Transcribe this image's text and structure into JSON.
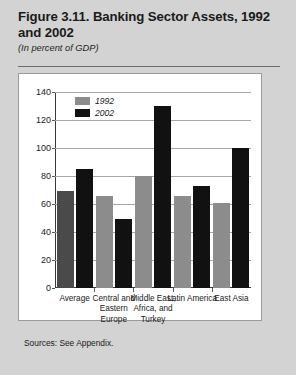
{
  "figure": {
    "title": "Figure 3.11. Banking Sector Assets, 1992 and 2002",
    "subtitle": "(In percent of GDP)",
    "sources": "Sources: See Appendix."
  },
  "colors": {
    "page_background": "#d3d3d3",
    "panel_background": "#ffffff",
    "series_1992": "#8c8c8c",
    "series_2002": "#111111",
    "series_1992_average": "#4a4a4a",
    "gridline": "#a7a7a7",
    "axis": "#3a3a3a"
  },
  "chart_data": {
    "type": "bar",
    "title": "Figure 3.11. Banking Sector Assets, 1992 and 2002",
    "subtitle": "(In percent of GDP)",
    "xlabel": "",
    "ylabel": "",
    "ylim": [
      0,
      140
    ],
    "yticks": [
      0,
      20,
      40,
      60,
      80,
      100,
      120,
      140
    ],
    "grid": true,
    "legend_position": "top-left",
    "categories": [
      "Average",
      "Central and Eastern Europe",
      "Middle East, Africa, and Turkey",
      "Latin America",
      "East Asia"
    ],
    "series": [
      {
        "name": "1992",
        "values": [
          69,
          66,
          80,
          66,
          61
        ]
      },
      {
        "name": "2002",
        "values": [
          85,
          49,
          130,
          73,
          100
        ]
      }
    ]
  }
}
